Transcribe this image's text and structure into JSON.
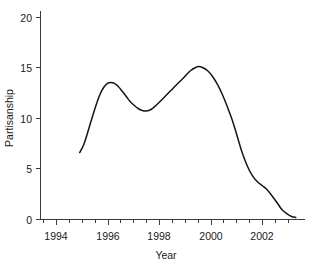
{
  "chart_data": {
    "type": "line",
    "title": "",
    "xlabel": "Year",
    "ylabel": "Partisanship",
    "xlim": [
      1993.45,
      2003.45
    ],
    "ylim": [
      0,
      21.7
    ],
    "grid": false,
    "legend": null,
    "x_ticks": [
      1994,
      1996,
      1998,
      2000,
      2002
    ],
    "x_tick_labels": [
      "1994",
      "1996",
      "1998",
      "2000",
      "2002"
    ],
    "x_minor_ticks": [
      1993.5,
      1994.5,
      1995,
      1995.5,
      1996.5,
      1997,
      1997.5,
      1998.5,
      1999,
      1999.5,
      2000.5,
      2001,
      2001.5,
      2002.5,
      2003
    ],
    "y_ticks": [
      0,
      5,
      10,
      15,
      20
    ],
    "y_tick_labels": [
      "0",
      "5",
      "10",
      "15",
      "20"
    ],
    "line_color": "#151515",
    "series": [
      {
        "name": "Partisanship",
        "x": [
          1994.92,
          1995.08,
          1995.23,
          1995.38,
          1995.54,
          1995.69,
          1995.85,
          1996.0,
          1996.12,
          1996.27,
          1996.42,
          1996.58,
          1996.73,
          1996.88,
          1997.04,
          1997.19,
          1997.35,
          1997.5,
          1997.69,
          1997.88,
          1998.08,
          1998.27,
          1998.46,
          1998.65,
          1998.85,
          1999.04,
          1999.23,
          1999.42,
          1999.54,
          1999.69,
          1999.88,
          2000.08,
          2000.27,
          2000.46,
          2000.65,
          2000.85,
          2001.04,
          2001.23,
          2001.42,
          2001.62,
          2001.81,
          2002.0,
          2002.19,
          2002.38,
          2002.58,
          2002.77,
          2002.96,
          2003.15,
          2003.31
        ],
        "y": [
          6.63,
          7.43,
          8.61,
          9.9,
          11.19,
          12.28,
          13.07,
          13.47,
          13.56,
          13.47,
          13.17,
          12.67,
          12.18,
          11.68,
          11.29,
          10.99,
          10.79,
          10.74,
          10.89,
          11.29,
          11.78,
          12.28,
          12.77,
          13.27,
          13.76,
          14.26,
          14.75,
          15.05,
          15.15,
          15.05,
          14.75,
          14.16,
          13.37,
          12.38,
          11.19,
          9.8,
          8.22,
          6.63,
          5.35,
          4.36,
          3.76,
          3.37,
          2.97,
          2.38,
          1.68,
          0.99,
          0.59,
          0.3,
          0.2
        ]
      }
    ]
  },
  "axes": {
    "y_title": "Partisanship",
    "x_title": "Year"
  }
}
